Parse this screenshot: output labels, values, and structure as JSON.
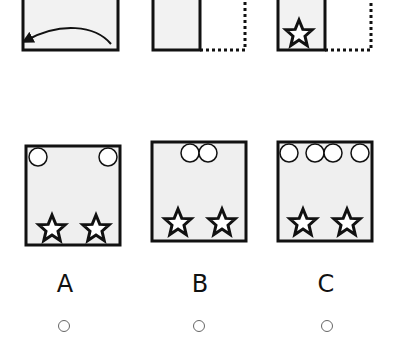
{
  "question": {
    "steps": [
      {
        "id": "step-1",
        "description": "Folded square with arrow folding right half onto left",
        "icon": "curved-arrow-icon"
      },
      {
        "id": "step-2",
        "description": "Left half solid, right half dotted (folded)",
        "icon": "none"
      },
      {
        "id": "step-3",
        "description": "Folded sheet with star punched at bottom",
        "icon": "star-icon"
      }
    ]
  },
  "options": [
    {
      "label": "A",
      "circles": 2,
      "stars": 2,
      "selected": false
    },
    {
      "label": "B",
      "circles": 2,
      "stars": 2,
      "selected": false
    },
    {
      "label": "C",
      "circles": 4,
      "stars": 2,
      "selected": false
    }
  ],
  "colors": {
    "stroke": "#111111",
    "panel_fill": "#f0f0f0",
    "background": "#ffffff"
  }
}
